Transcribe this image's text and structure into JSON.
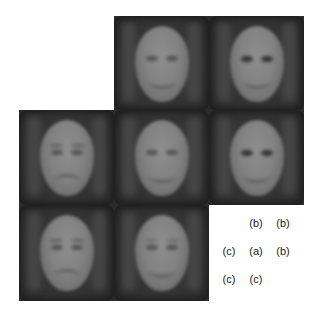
{
  "figure": {
    "tiles": [
      {
        "row": 0,
        "col": 1,
        "variant": "b"
      },
      {
        "row": 0,
        "col": 2,
        "variant": "b"
      },
      {
        "row": 1,
        "col": 0,
        "variant": "c"
      },
      {
        "row": 1,
        "col": 1,
        "variant": "a"
      },
      {
        "row": 1,
        "col": 2,
        "variant": "b"
      },
      {
        "row": 2,
        "col": 0,
        "variant": "c"
      },
      {
        "row": 2,
        "col": 1,
        "variant": "c"
      }
    ],
    "labels": {
      "row0": [
        "(b)",
        "(b)"
      ],
      "row1": [
        "(c)",
        "(a)",
        "(b)"
      ],
      "row2": [
        "(c)",
        "(c)"
      ]
    }
  }
}
